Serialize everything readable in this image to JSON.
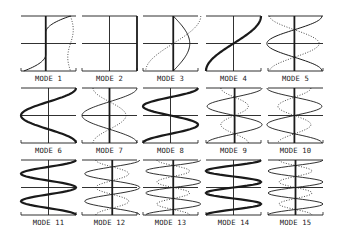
{
  "figure": {
    "background": "#ffffff",
    "ink": "#1a1a1a",
    "rows": 3,
    "cols": 5,
    "col_left": [
      21,
      82,
      143,
      206,
      268
    ],
    "panel_width": 55,
    "row_top": [
      16,
      88,
      160
    ],
    "panel_height": 55,
    "label_offset": 12
  },
  "panels": [
    {
      "label": "MODE 1",
      "axis": 0.45,
      "axis_bold": true,
      "solid": {
        "n": 0.5,
        "amp": 0.45,
        "type": "edge1",
        "w": 1.0
      },
      "dotted": {
        "type": "wavy_right"
      }
    },
    {
      "label": "MODE 2",
      "axis": 0.5,
      "axis_bold": false,
      "right_bold": true,
      "solid": null,
      "dotted": null
    },
    {
      "label": "MODE 3",
      "axis": 0.55,
      "axis_bold": true,
      "solid": {
        "type": "halfsine",
        "amp": 0.3,
        "w": 1.0
      },
      "dotted": {
        "type": "sin1",
        "amp": 0.5
      }
    },
    {
      "label": "MODE 4",
      "axis": 0.5,
      "axis_bold": false,
      "solid": {
        "type": "sin1",
        "amp": 0.5,
        "w": 2.2
      },
      "dotted": null
    },
    {
      "label": "MODE 5",
      "axis": 0.48,
      "axis_bold": true,
      "solid": {
        "type": "sin2",
        "amp": 0.5,
        "w": 1.0
      },
      "dotted": {
        "type": "sin2",
        "amp": -0.45
      }
    },
    {
      "label": "MODE 6",
      "axis": 0.5,
      "axis_bold": false,
      "solid": {
        "type": "cos2",
        "amp": 0.5,
        "w": 2.2
      },
      "dotted": null
    },
    {
      "label": "MODE 7",
      "axis": 0.5,
      "axis_bold": true,
      "solid": {
        "type": "cos2s",
        "amp": 0.5,
        "w": 0.9
      },
      "dotted": {
        "type": "cos2s",
        "amp": -0.3
      }
    },
    {
      "label": "MODE 8",
      "axis": 0.5,
      "axis_bold": false,
      "solid": {
        "type": "sin3",
        "amp": 0.5,
        "w": 2.2
      },
      "dotted": null
    },
    {
      "label": "MODE 9",
      "axis": 0.52,
      "axis_bold": true,
      "solid": {
        "type": "sin3",
        "amp": 0.5,
        "w": 0.9
      },
      "dotted": {
        "type": "sin3",
        "amp": -0.25
      }
    },
    {
      "label": "MODE 10",
      "axis": 0.48,
      "axis_bold": true,
      "solid": {
        "type": "sin3r",
        "amp": 0.5,
        "w": 0.9
      },
      "dotted": {
        "type": "sin3r",
        "amp": -0.3
      }
    },
    {
      "label": "MODE 11",
      "axis": 0.5,
      "axis_bold": false,
      "solid": {
        "type": "cos4",
        "amp": 0.5,
        "w": 2.2
      },
      "dotted": null
    },
    {
      "label": "MODE 12",
      "axis": 0.55,
      "axis_bold": true,
      "solid": {
        "type": "cos4",
        "amp": 0.5,
        "w": 0.9
      },
      "dotted": {
        "type": "cos4",
        "amp": -0.3
      }
    },
    {
      "label": "MODE 13",
      "axis": 0.55,
      "axis_bold": true,
      "solid": {
        "type": "sin5",
        "amp": 0.5,
        "w": 0.9
      },
      "dotted": {
        "type": "sin5",
        "amp": -0.3
      }
    },
    {
      "label": "MODE 14",
      "axis": 0.5,
      "axis_bold": false,
      "solid": {
        "type": "sin5",
        "amp": 0.5,
        "w": 2.2
      },
      "dotted": null
    },
    {
      "label": "MODE 15",
      "axis": 0.5,
      "axis_bold": true,
      "solid": {
        "type": "cos5",
        "amp": 0.5,
        "w": 0.9
      },
      "dotted": {
        "type": "cos5",
        "amp": -0.3
      }
    }
  ]
}
